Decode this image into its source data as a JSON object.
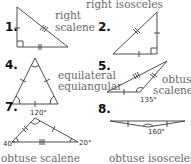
{
  "colors": {
    "line": "#3a3a3a",
    "label_text": "#6a6a6a",
    "number_text": "#111111",
    "angle_text": "#333333",
    "background": "#ffffff"
  },
  "problems": [
    {
      "number": "1.",
      "classification": [
        "right",
        "scalene"
      ],
      "angles": [],
      "marks": "right-angle, three different tick marks"
    },
    {
      "number": "2.",
      "classification": [
        "right isosceles"
      ],
      "angles": [],
      "marks": "right-angle, two legs single tick"
    },
    {
      "number": "4.",
      "classification": [
        "equilateral",
        "equiangular"
      ],
      "angles": [],
      "marks": "all sides single tick, all angles single arc"
    },
    {
      "number": "5.",
      "classification": [
        "obtuse",
        "scalene"
      ],
      "angles": [
        "135°"
      ],
      "marks": "sides with 1, 2, 3 ticks"
    },
    {
      "number": "7.",
      "classification": [
        "obtuse scalene"
      ],
      "angles": [
        "120°",
        "40°",
        "20°"
      ],
      "marks": "sides with 1, 2, 3 ticks"
    },
    {
      "number": "8.",
      "classification": [
        "obtuse isosceles"
      ],
      "angles": [
        "160°"
      ],
      "marks": "two equal short sides"
    }
  ]
}
